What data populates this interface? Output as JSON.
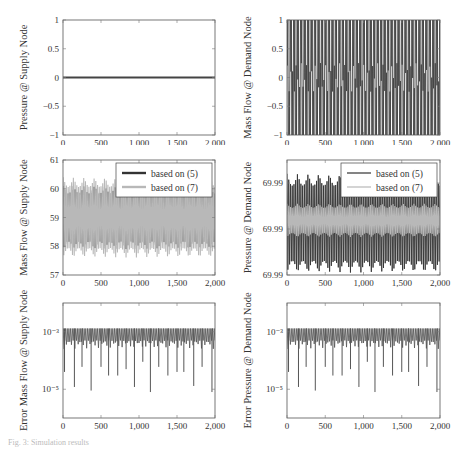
{
  "figure": {
    "caption": "Fig. 3: Simulation results"
  },
  "chart_data": [
    {
      "id": "p1",
      "type": "line",
      "ylabel": "Pressure @ Supply Node",
      "xlabel": "",
      "xlim": [
        0,
        2000
      ],
      "xticks": [
        0,
        500,
        1000,
        1500,
        2000
      ],
      "xtick_labels": [
        "0",
        "500",
        "1,000",
        "1,500",
        "2,000"
      ],
      "ylim": [
        -1,
        1
      ],
      "yticks": [
        -1,
        -0.5,
        0,
        0.5,
        1
      ],
      "ytick_labels": [
        "−1",
        "−0.5",
        "0",
        "0.5",
        "1"
      ],
      "yscale": "linear",
      "series": [
        {
          "name": "pressure",
          "color": "#444444",
          "pattern": "flat",
          "value": 0.0
        }
      ],
      "legend": null
    },
    {
      "id": "p2",
      "type": "line",
      "ylabel": "Mass Flow @ Demand Node",
      "xlim": [
        0,
        2000
      ],
      "xticks": [
        0,
        500,
        1000,
        1500,
        2000
      ],
      "xtick_labels": [
        "0",
        "500",
        "1,000",
        "1,500",
        "2,000"
      ],
      "ylim": [
        -1,
        1
      ],
      "yticks": [
        -1,
        -0.5,
        0,
        0.5,
        1
      ],
      "ytick_labels": [
        "−1",
        "−0.5",
        "0",
        "0.5",
        "1"
      ],
      "yscale": "linear",
      "series": [
        {
          "name": "mass flow",
          "color": "#444444",
          "pattern": "square_oscillation",
          "min": -1,
          "max": 1,
          "periods": 44
        }
      ],
      "legend": null
    },
    {
      "id": "p3",
      "type": "line",
      "ylabel": "Mass Flow @ Supply Node",
      "xlim": [
        0,
        2000
      ],
      "xticks": [
        0,
        500,
        1000,
        1500,
        2000
      ],
      "xtick_labels": [
        "0",
        "500",
        "1,000",
        "1,500",
        "2,000"
      ],
      "ylim": [
        57,
        61
      ],
      "yticks": [
        57,
        58,
        59,
        60,
        61
      ],
      "ytick_labels": [
        "57",
        "58",
        "59",
        "60",
        "61"
      ],
      "yscale": "linear",
      "series": [
        {
          "name": "based on (5)",
          "color": "#333333",
          "pattern": "oscillation",
          "min": 57.9,
          "max": 60.1,
          "periods": 44
        },
        {
          "name": "based on (7)",
          "color": "#b8b8b8",
          "pattern": "oscillation",
          "min": 57.6,
          "max": 60.4,
          "periods": 44
        }
      ],
      "legend": {
        "position": "upper right",
        "entries": [
          "based on (5)",
          "based on (7)"
        ]
      }
    },
    {
      "id": "p4",
      "type": "line",
      "ylabel": "Pressure @ Demand Node",
      "xlim": [
        0,
        2000
      ],
      "xticks": [
        0,
        500,
        1000,
        1500,
        2000
      ],
      "xtick_labels": [
        "0",
        "500",
        "1,000",
        "1,500",
        "2,000"
      ],
      "ylim": [
        0,
        1
      ],
      "yticks": [
        0,
        0.5,
        1
      ],
      "ytick_labels": [
        "69.99",
        "69.99",
        "69.99"
      ],
      "ytick_positions": [
        0,
        0.4,
        0.8
      ],
      "yscale": "linear",
      "series": [
        {
          "name": "based on (5)",
          "color": "#333333",
          "pattern": "oscillation",
          "min": 0.02,
          "max": 0.88,
          "periods": 44
        },
        {
          "name": "based on (7)",
          "color": "#b8b8b8",
          "pattern": "oscillation",
          "min": 0.33,
          "max": 0.62,
          "periods": 44
        }
      ],
      "legend": {
        "position": "upper right",
        "entries": [
          "based on (5)",
          "based on (7)"
        ]
      }
    },
    {
      "id": "p5",
      "type": "line",
      "ylabel": "Error Mass Flow @ Supply Node",
      "xlim": [
        0,
        2000
      ],
      "xticks": [
        0,
        500,
        1000,
        1500,
        2000
      ],
      "xtick_labels": [
        "0",
        "500",
        "1,000",
        "1,500",
        "2,000"
      ],
      "ylim": [
        1e-06,
        0.01
      ],
      "yticks": [
        0.001,
        1e-05
      ],
      "ytick_labels": [
        "10⁻³",
        "10⁻⁵"
      ],
      "yscale": "log",
      "series": [
        {
          "name": "error",
          "color": "#555555",
          "pattern": "error_spikes",
          "top": 0.0013,
          "base": 0.0005,
          "dips": [
            [
              20,
              4e-05
            ],
            [
              150,
              1.2e-05
            ],
            [
              250,
              6e-05
            ],
            [
              370,
              9e-06
            ],
            [
              500,
              6e-05
            ],
            [
              600,
              3e-05
            ],
            [
              720,
              3e-05
            ],
            [
              830,
              5e-05
            ],
            [
              940,
              1.2e-05
            ],
            [
              1050,
              9e-05
            ],
            [
              1150,
              8e-06
            ],
            [
              1260,
              6e-05
            ],
            [
              1380,
              3e-05
            ],
            [
              1500,
              4e-05
            ],
            [
              1590,
              4e-05
            ],
            [
              1720,
              1.3e-05
            ],
            [
              1830,
              6e-05
            ],
            [
              1960,
              8e-06
            ]
          ]
        }
      ],
      "legend": null
    },
    {
      "id": "p6",
      "type": "line",
      "ylabel": "Error Pressure @ Demand Node",
      "xlim": [
        0,
        2000
      ],
      "xticks": [
        0,
        500,
        1000,
        1500,
        2000
      ],
      "xtick_labels": [
        "0",
        "500",
        "1,000",
        "1,500",
        "2,000"
      ],
      "ylim": [
        1e-06,
        0.01
      ],
      "yticks": [
        0.001,
        1e-05
      ],
      "ytick_labels": [
        "10⁻³",
        "10⁻⁵"
      ],
      "yscale": "log",
      "series": [
        {
          "name": "error",
          "color": "#555555",
          "pattern": "error_spikes",
          "top": 0.0013,
          "base": 0.0005,
          "dips": [
            [
              20,
              4e-05
            ],
            [
              150,
              1.2e-05
            ],
            [
              250,
              6e-05
            ],
            [
              370,
              9e-06
            ],
            [
              500,
              6e-05
            ],
            [
              600,
              3e-05
            ],
            [
              720,
              3e-05
            ],
            [
              830,
              5e-05
            ],
            [
              940,
              1.2e-05
            ],
            [
              1050,
              9e-05
            ],
            [
              1150,
              8e-06
            ],
            [
              1260,
              6e-05
            ],
            [
              1380,
              3e-05
            ],
            [
              1500,
              4e-05
            ],
            [
              1590,
              4e-05
            ],
            [
              1720,
              1.3e-05
            ],
            [
              1830,
              6e-05
            ],
            [
              1960,
              8e-06
            ]
          ]
        }
      ],
      "legend": null
    }
  ]
}
